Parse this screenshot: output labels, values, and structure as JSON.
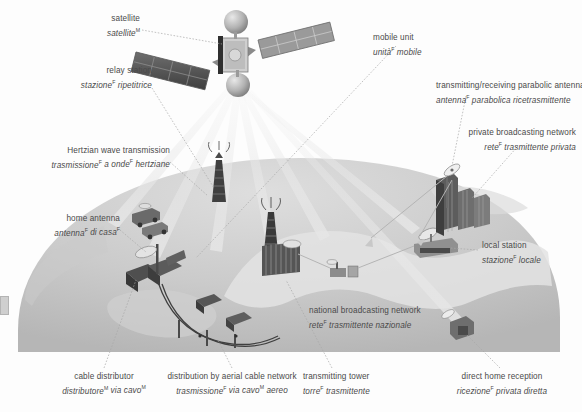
{
  "diagram": {
    "languages": [
      "English",
      "Italian"
    ],
    "gender_markers": {
      "masculine": "M",
      "feminine": "F"
    },
    "colors": {
      "background": "#fdfdfd",
      "text": "#4a4a4a",
      "leader_line": "#9d9d9d",
      "earth_light": "#d9d9d9",
      "earth_mid": "#c3c3c3",
      "earth_dark": "#b0b0b0",
      "land_light": "#e2e2e2",
      "structure_dark": "#5a5a5a",
      "structure_mid": "#8c8c8c",
      "beam": "#e9e9e9"
    }
  },
  "labels": [
    {
      "id": "satellite",
      "en": "satellite",
      "it_pre": "satellite",
      "it_sup": "M",
      "it_post": ""
    },
    {
      "id": "relay-station",
      "en": "relay station",
      "it_pre": "stazione",
      "it_sup": "F",
      "it_post": " ripetitrice"
    },
    {
      "id": "hertzian-wave",
      "en": "Hertzian wave transmission",
      "it_pre": "trasmissione",
      "it_sup": "F",
      "it_post": " a onde<sup>F</sup> hertziane"
    },
    {
      "id": "home-antenna",
      "en": "home antenna",
      "it_pre": "antenna",
      "it_sup": "F",
      "it_post": " di casa<sup>F</sup>"
    },
    {
      "id": "cable-distributor",
      "en": "cable distributor",
      "it_pre": "distributore",
      "it_sup": "M",
      "it_post": " via cavo<sup>M</sup>"
    },
    {
      "id": "aerial-cable-network",
      "en": "distribution by aerial cable network",
      "it_pre": "trasmissione",
      "it_sup": "F",
      "it_post": " via cavo<sup>M</sup> aereo"
    },
    {
      "id": "transmitting-tower",
      "en": "transmitting tower",
      "it_pre": "torre",
      "it_sup": "F",
      "it_post": " trasmittente"
    },
    {
      "id": "national-network",
      "en": "national broadcasting network",
      "it_pre": "rete",
      "it_sup": "F",
      "it_post": " trasmittente nazionale"
    },
    {
      "id": "direct-home-reception",
      "en": "direct home reception",
      "it_pre": "ricezione",
      "it_sup": "F",
      "it_post": " privata diretta"
    },
    {
      "id": "local-station",
      "en": "local station",
      "it_pre": "stazione",
      "it_sup": "F",
      "it_post": " locale"
    },
    {
      "id": "private-network",
      "en": "private broadcasting network",
      "it_pre": "rete",
      "it_sup": "F",
      "it_post": " trasmittente privata"
    },
    {
      "id": "parabolic-antenna",
      "en": "transmitting/receiving parabolic antenna",
      "it_pre": "antenna",
      "it_sup": "F",
      "it_post": " parabolica ricetrasmittente"
    },
    {
      "id": "mobile-unit",
      "en": "mobile unit",
      "it_pre": "unità",
      "it_sup": "F",
      "it_post": " mobile"
    }
  ]
}
